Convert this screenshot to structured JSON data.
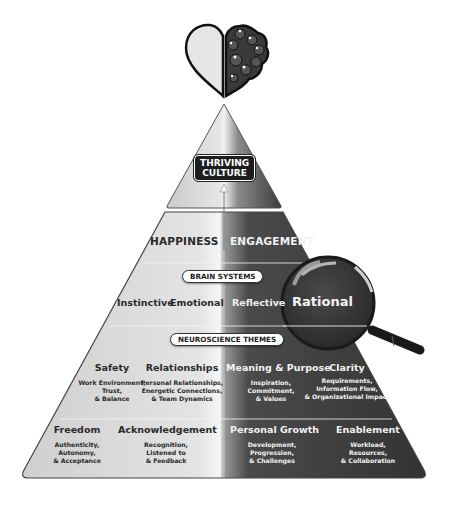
{
  "header_icon": {
    "name": "heart-brain-icon",
    "description": "half heart, half brain"
  },
  "apex": {
    "label_line1": "THRIVING",
    "label_line2": "CULTURE"
  },
  "outcomes": {
    "left": "HAPPINESS",
    "right": "ENGAGEMENT"
  },
  "brain_systems": {
    "pill": "BRAIN SYSTEMS",
    "items": [
      "Instinctive",
      "Emotional",
      "Reflective",
      "Rational"
    ],
    "highlighted": "Rational"
  },
  "neuroscience_themes": {
    "pill": "NEUROSCIENCE THEMES",
    "row1": [
      {
        "title": "Safety",
        "lines": [
          "Work Environment,",
          "Trust,",
          "& Balance"
        ]
      },
      {
        "title": "Relationships",
        "lines": [
          "Personal Relationships,",
          "Energetic Connections,",
          "& Team Dynamics"
        ]
      },
      {
        "title": "Meaning & Purpose",
        "lines": [
          "Inspiration,",
          "Commitment,",
          "& Values"
        ]
      },
      {
        "title": "Clarity",
        "lines": [
          "Requirements,",
          "Information Flow,",
          "& Organizational Impact"
        ]
      }
    ],
    "row2": [
      {
        "title": "Freedom",
        "lines": [
          "Authenticity,",
          "Autonomy,",
          "& Acceptance"
        ]
      },
      {
        "title": "Acknowledgement",
        "lines": [
          "Recognition,",
          "Listened to",
          "& Feedback"
        ]
      },
      {
        "title": "Personal Growth",
        "lines": [
          "Development,",
          "Progression,",
          "& Challenges"
        ]
      },
      {
        "title": "Enablement",
        "lines": [
          "Workload,",
          "Resources,",
          "& Collaboration"
        ]
      }
    ]
  },
  "colors": {
    "light_side": "#d9d9d9",
    "dark_side": "#3a3a3a",
    "badge": "#1d1d1d"
  }
}
